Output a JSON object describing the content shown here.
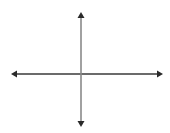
{
  "diagram": {
    "type": "coordinate-axes",
    "origin": {
      "x": 81,
      "y": 74
    },
    "horizontal_axis": {
      "x1": 11,
      "x2": 163,
      "y": 74,
      "color": "#3a3a3a",
      "arrowheads": [
        "left",
        "right"
      ]
    },
    "vertical_axis": {
      "y1": 12,
      "y2": 127,
      "x": 81,
      "color": "#8a8a8a",
      "arrowheads": [
        "up",
        "down"
      ]
    },
    "arrowhead_color": "#2a2a2a",
    "background": "#ffffff"
  }
}
